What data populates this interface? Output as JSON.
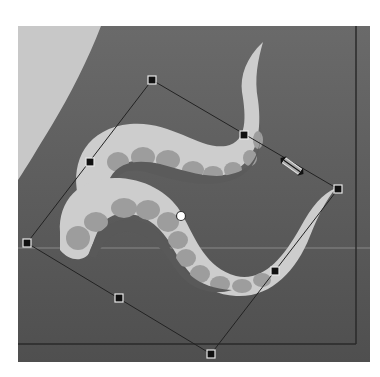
{
  "canvas": {
    "x": 18,
    "y": 26,
    "width": 352,
    "height": 336,
    "background": "#5f5f5f",
    "page_border_color": "#2b2b2b",
    "page_border_right_x": 356,
    "page_border_bottom_y": 344,
    "guide_line_y": 248,
    "guide_color": "#737373"
  },
  "artwork": {
    "light_shape_color": "#c9c9c9",
    "tentacle_color": "#cdcdcd",
    "sucker_color": "#9a9a9a"
  },
  "transform_box": {
    "line_color": "#222222",
    "corners": [
      {
        "name": "top",
        "x": 152,
        "y": 80
      },
      {
        "name": "right",
        "x": 338,
        "y": 189
      },
      {
        "name": "bottom",
        "x": 211,
        "y": 354
      },
      {
        "name": "left",
        "x": 27,
        "y": 243
      }
    ],
    "edge_handles": [
      {
        "name": "top-right-mid",
        "x": 244,
        "y": 135
      },
      {
        "name": "right-bottom-mid",
        "x": 275,
        "y": 271
      },
      {
        "name": "bottom-left-mid",
        "x": 119,
        "y": 298
      },
      {
        "name": "left-top-mid",
        "x": 90,
        "y": 162
      }
    ],
    "center_point": {
      "x": 181,
      "y": 216
    },
    "handle_fill": "#111111",
    "handle_stroke": "#e8e8e8"
  },
  "cursor": {
    "type": "rotate-cursor",
    "x": 292,
    "y": 166
  }
}
